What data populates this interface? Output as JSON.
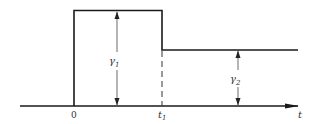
{
  "diagram": {
    "type": "pulse-step-waveform",
    "axis": {
      "label": "t",
      "origin_label": "0",
      "time_marker": {
        "base": "t",
        "sub": "1"
      }
    },
    "levels": [
      {
        "name": "gamma-1",
        "base": "γ",
        "sub": "1",
        "description": "pulse height from 0 to t1"
      },
      {
        "name": "gamma-2",
        "base": "γ",
        "sub": "2",
        "description": "step height after t1"
      }
    ],
    "colors": {
      "line": "#1a1a1a",
      "thin_line": "#444444",
      "text": "#333333",
      "background": "#ffffff"
    }
  }
}
